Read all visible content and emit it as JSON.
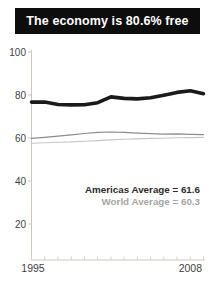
{
  "header": {
    "title": "The economy is 80.6% free",
    "bg_color": "#0d0d0d",
    "text_color": "#ffffff"
  },
  "chart_data": {
    "type": "line",
    "title": "",
    "xlabel": "",
    "ylabel": "",
    "x": [
      1995,
      1996,
      1997,
      1998,
      1999,
      2000,
      2001,
      2002,
      2003,
      2004,
      2005,
      2006,
      2007,
      2008
    ],
    "series": [
      {
        "name": "Country economic freedom score",
        "color": "#1a1a1a",
        "stroke_width": 3.6,
        "values": [
          76.7,
          76.7,
          75.6,
          75.4,
          75.5,
          76.4,
          79.1,
          78.4,
          78.2,
          78.7,
          79.9,
          81.2,
          82.0,
          80.6
        ]
      },
      {
        "name": "Americas Average",
        "color": "#8c8c8c",
        "stroke_width": 1.2,
        "values": [
          59.8,
          60.3,
          60.9,
          61.5,
          62.1,
          62.6,
          62.8,
          62.6,
          62.3,
          62.0,
          61.8,
          61.9,
          61.7,
          61.6
        ]
      },
      {
        "name": "World Average",
        "color": "#c6c6c6",
        "stroke_width": 1.1,
        "values": [
          57.6,
          57.8,
          58.0,
          58.2,
          58.5,
          58.8,
          59.1,
          59.4,
          59.6,
          59.8,
          59.9,
          60.1,
          60.2,
          60.3
        ]
      }
    ],
    "ylim": [
      0,
      100
    ],
    "y_ticks": [
      100,
      80,
      60,
      40,
      20
    ],
    "x_tick_labels": [
      "1995",
      "2008"
    ],
    "grid": false,
    "legend_position": "none",
    "axis_color": "#ccc5bf",
    "tick_color": "#d6d0ca",
    "tick_label_color": "#3f3f3f",
    "annotations": [
      {
        "text": "Americas Average = 61.6",
        "color": "#2b2b2b"
      },
      {
        "text": "World Average = 60.3",
        "color": "#a5a5a5"
      }
    ]
  }
}
